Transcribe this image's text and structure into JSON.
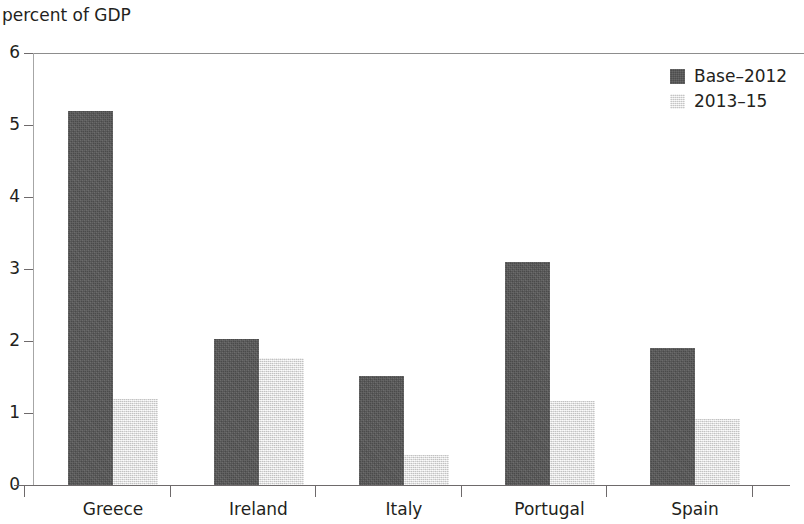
{
  "chart_data": {
    "type": "bar",
    "title": "percent of GDP",
    "xlabel": "",
    "ylabel": "",
    "ylim": [
      0,
      6
    ],
    "yticks": [
      0,
      1,
      2,
      3,
      4,
      5,
      6
    ],
    "ytick_labels": [
      "0",
      "1",
      "2",
      "3",
      "4",
      "5",
      "6"
    ],
    "grid": false,
    "legend_position": "top-right",
    "categories": [
      "Greece",
      "Ireland",
      "Italy",
      "Portugal",
      "Spain"
    ],
    "series": [
      {
        "name": "Base–2012",
        "color": "#565656",
        "values": [
          5.2,
          2.03,
          1.51,
          3.1,
          1.9
        ]
      },
      {
        "name": "2013–15",
        "color": "#e8e8e8",
        "values": [
          1.2,
          1.76,
          0.42,
          1.17,
          0.92
        ]
      }
    ]
  }
}
